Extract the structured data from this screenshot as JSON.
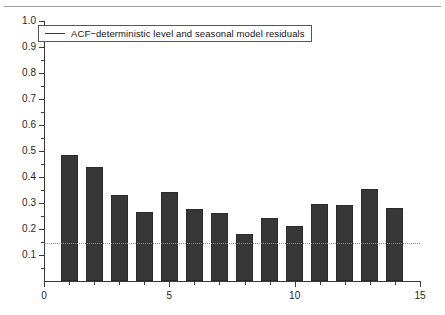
{
  "chart_data": {
    "type": "bar",
    "title": "",
    "subtitle": "",
    "xlabel": "",
    "ylabel": "",
    "categories": [
      1,
      2,
      3,
      4,
      5,
      6,
      7,
      8,
      9,
      10,
      11,
      12,
      13,
      14
    ],
    "values": [
      0.485,
      0.437,
      0.329,
      0.267,
      0.341,
      0.277,
      0.261,
      0.18,
      0.242,
      0.213,
      0.295,
      0.294,
      0.354,
      0.282
    ],
    "series": [
      {
        "name": "ACF−deterministic level and seasonal model residuals",
        "values": [
          0.485,
          0.437,
          0.329,
          0.267,
          0.341,
          0.277,
          0.261,
          0.18,
          0.242,
          0.213,
          0.295,
          0.294,
          0.354,
          0.282
        ]
      }
    ],
    "xlim": [
      0,
      15
    ],
    "ylim": [
      0,
      1.0
    ],
    "x_ticks_major": [
      0,
      5,
      10,
      15
    ],
    "x_tick_labels": [
      "0",
      "5",
      "10",
      "15"
    ],
    "x_ticks_minor": [
      1,
      2,
      3,
      4,
      6,
      7,
      8,
      9,
      11,
      12,
      13,
      14
    ],
    "y_ticks": [
      0.1,
      0.2,
      0.3,
      0.4,
      0.5,
      0.6,
      0.7,
      0.8,
      0.9,
      1.0
    ],
    "y_tick_labels": [
      "0.1",
      "0.2",
      "0.3",
      "0.4",
      "0.5",
      "0.6",
      "0.7",
      "0.8",
      "0.9",
      "1.0"
    ],
    "grid": false,
    "annotations": [
      {
        "name": "significance-threshold",
        "type": "horizontal-line",
        "value": 0.145,
        "style": "dotted",
        "color": "#8d8d8d"
      }
    ],
    "legend": {
      "position": "top-left",
      "entries": [
        {
          "label": "ACF−deterministic level and seasonal model residuals",
          "marker": "line",
          "color": "#3c3c3c"
        }
      ]
    },
    "colors": {
      "bar_fill": "#373737",
      "bar_edge": "#2b2b2b",
      "axis": "#3a3a3a",
      "threshold_line": "#8d8d8d",
      "top_rule": "#9b9b9b",
      "text": "#1f1f1f"
    }
  }
}
